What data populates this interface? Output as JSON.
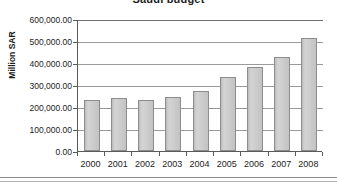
{
  "chart_data": {
    "type": "bar",
    "title": "Saudi budget",
    "xlabel": "",
    "ylabel": "Million SAR",
    "categories": [
      "2000",
      "2001",
      "2002",
      "2003",
      "2004",
      "2005",
      "2006",
      "2007",
      "2008"
    ],
    "values": [
      230000,
      240000,
      230000,
      245000,
      272000,
      335000,
      382000,
      428000,
      515000
    ],
    "ylim": [
      0,
      600000
    ],
    "ytick_labels": [
      "600,000.00",
      "500,000.00",
      "400,000.00",
      "300,000.00",
      "200,000.00",
      "100,000.00",
      "0.00"
    ],
    "ytick_values": [
      600000,
      500000,
      400000,
      300000,
      200000,
      100000,
      0
    ],
    "grid": true,
    "legend": false,
    "series": [
      {
        "name": "Saudi budget",
        "color": "#c9c9c9",
        "border_color": "#8d8d8d",
        "values": [
          230000,
          240000,
          230000,
          245000,
          272000,
          335000,
          382000,
          428000,
          515000
        ]
      }
    ]
  },
  "colors": {
    "bar_fill": "#c9c9c9",
    "bar_border": "#8d8d8d",
    "gridline": "#9a9a9a",
    "axis": "#5a5a5a",
    "text": "#1c1c1c",
    "background": "#ffffff"
  }
}
